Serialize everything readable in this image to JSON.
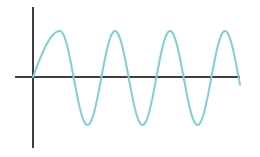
{
  "figure": {
    "colors": {
      "background": "#ffffff",
      "axis": "#3f3f3f",
      "wave": "#7fcfd5"
    },
    "axes": {
      "origin": [
        33,
        77
      ],
      "x_axis": {
        "from": 15,
        "to": 240
      },
      "y_axis": {
        "from": 7,
        "to": 148
      }
    },
    "wave": {
      "start": [
        33,
        77
      ],
      "first_peak": [
        60,
        31
      ],
      "period_px": 55,
      "amplitude_px": 47,
      "midline_y": 78,
      "peaks_x": [
        60,
        115,
        170,
        225
      ],
      "troughs_x": [
        88,
        143,
        198
      ],
      "end": [
        240,
        40
      ]
    }
  }
}
